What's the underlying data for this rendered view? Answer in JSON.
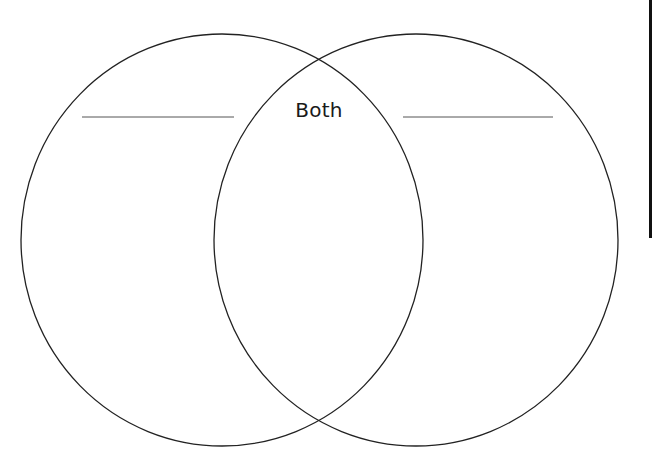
{
  "diagram": {
    "type": "venn",
    "sets": 2,
    "intersection_label": "Both",
    "left_circle": {
      "cx": 222,
      "cy": 240,
      "rx": 201,
      "ry": 206,
      "title_line": {
        "x1": 82,
        "x2": 234,
        "y": 117
      }
    },
    "right_circle": {
      "cx": 416,
      "cy": 240,
      "rx": 202,
      "ry": 206,
      "title_line": {
        "x1": 403,
        "x2": 553,
        "y": 117
      }
    },
    "colors": {
      "stroke": "#222222",
      "title_line": "#555555",
      "background": "#ffffff",
      "text": "#1a1a1a"
    }
  }
}
